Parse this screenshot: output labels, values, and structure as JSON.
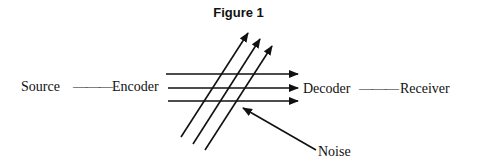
{
  "figure": {
    "title": "Figure 1",
    "labels": {
      "source": "Source",
      "encoder": "Encoder",
      "decoder": "Decoder",
      "receiver": "Receiver",
      "noise": "Noise"
    },
    "connectors": {
      "source_encoder": "———",
      "decoder_receiver": "———"
    },
    "line_color": "#111111",
    "signal_arrows": [
      {
        "x1": 166,
        "y1": 74,
        "x2": 298,
        "y2": 74
      },
      {
        "x1": 168,
        "y1": 88,
        "x2": 298,
        "y2": 88
      },
      {
        "x1": 168,
        "y1": 101,
        "x2": 298,
        "y2": 101
      }
    ],
    "noise_arrows": [
      {
        "x1": 181,
        "y1": 137,
        "x2": 248,
        "y2": 33
      },
      {
        "x1": 193,
        "y1": 144,
        "x2": 260,
        "y2": 39
      },
      {
        "x1": 205,
        "y1": 150,
        "x2": 272,
        "y2": 46
      }
    ],
    "noise_pointer": {
      "x1": 316,
      "y1": 150,
      "x2": 243,
      "y2": 108
    }
  }
}
